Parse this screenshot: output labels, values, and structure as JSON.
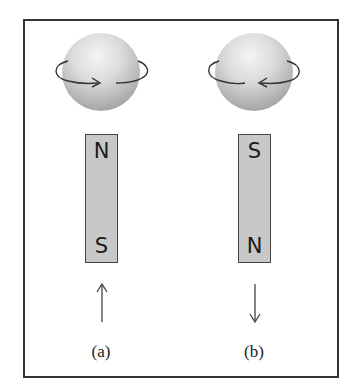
{
  "figure": {
    "panels": [
      {
        "id": "a",
        "caption": "(a)",
        "spin_direction": "counterclockwise-front-right",
        "magnet": {
          "top_pole": "N",
          "bottom_pole": "S",
          "color": "#c8c8c8"
        },
        "arrow": "up-arrow"
      },
      {
        "id": "b",
        "caption": "(b)",
        "spin_direction": "clockwise-front-left",
        "magnet": {
          "top_pole": "S",
          "bottom_pole": "N",
          "color": "#c8c8c8"
        },
        "arrow": "down-arrow"
      }
    ]
  }
}
